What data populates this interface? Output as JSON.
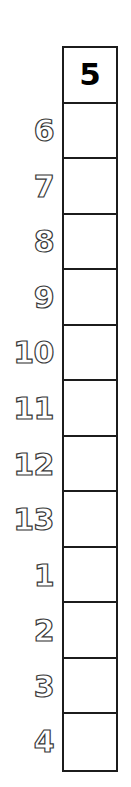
{
  "worksheet": {
    "type": "single-column-number-grid",
    "header_value": "5",
    "grid": {
      "rows": 13,
      "cells": [
        {
          "value": "5",
          "filled": true
        },
        {
          "value": "",
          "filled": false
        },
        {
          "value": "",
          "filled": false
        },
        {
          "value": "",
          "filled": false
        },
        {
          "value": "",
          "filled": false
        },
        {
          "value": "",
          "filled": false
        },
        {
          "value": "",
          "filled": false
        },
        {
          "value": "",
          "filled": false
        },
        {
          "value": "",
          "filled": false
        },
        {
          "value": "",
          "filled": false
        },
        {
          "value": "",
          "filled": false
        },
        {
          "value": "",
          "filled": false
        },
        {
          "value": "",
          "filled": false
        }
      ]
    },
    "row_labels": [
      {
        "label": "",
        "row": 1
      },
      {
        "label": "6",
        "row": 2
      },
      {
        "label": "7",
        "row": 3
      },
      {
        "label": "8",
        "row": 4
      },
      {
        "label": "9",
        "row": 5
      },
      {
        "label": "10",
        "row": 6
      },
      {
        "label": "11",
        "row": 7
      },
      {
        "label": "12",
        "row": 8
      },
      {
        "label": "13",
        "row": 9
      },
      {
        "label": "1",
        "row": 10
      },
      {
        "label": "2",
        "row": 11
      },
      {
        "label": "3",
        "row": 12
      },
      {
        "label": "4",
        "row": 13
      }
    ],
    "colors": {
      "grid_border": "#1c1c1c",
      "cell_background": "#ffffff",
      "filled_text": "#000000",
      "label_outline": "#3a3a3a",
      "label_fill": "#ffffff",
      "page_background": "#ffffff"
    }
  }
}
